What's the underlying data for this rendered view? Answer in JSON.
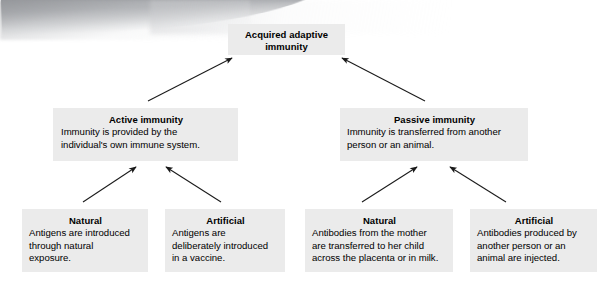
{
  "diagram": {
    "type": "hierarchy-tree",
    "nodes": {
      "root": {
        "title": "Acquired adaptive\nimmunity",
        "body": ""
      },
      "active": {
        "title": "Active immunity",
        "body": "Immunity is provided by the\nindividual's own immune system."
      },
      "passive": {
        "title": "Passive immunity",
        "body": "Immunity is transferred from another\nperson or an animal."
      },
      "active_natural": {
        "title": "Natural",
        "body": "Antigens are introduced\nthrough natural\nexposure."
      },
      "active_artificial": {
        "title": "Artificial",
        "body": "Antigens are\ndeliberately introduced\nin a vaccine."
      },
      "passive_natural": {
        "title": "Natural",
        "body": "Antibodies from the mother\nare transferred to her child\nacross the placenta or in milk."
      },
      "passive_artificial": {
        "title": "Artificial",
        "body": "Antibodies produced by\nanother person or an\nanimal are injected."
      }
    },
    "edges": [
      {
        "name": "active-to-root",
        "from": "active",
        "to": "root"
      },
      {
        "name": "passive-to-root",
        "from": "passive",
        "to": "root"
      },
      {
        "name": "active-natural-to-active",
        "from": "active_natural",
        "to": "active"
      },
      {
        "name": "active-artificial-to-active",
        "from": "active_artificial",
        "to": "active"
      },
      {
        "name": "passive-natural-to-passive",
        "from": "passive_natural",
        "to": "passive"
      },
      {
        "name": "passive-artificial-to-passive",
        "from": "passive_artificial",
        "to": "passive"
      }
    ],
    "colors": {
      "box_fill": "#ebebeb",
      "text": "#000000",
      "arrow": "#1a1a1a",
      "background": "#ffffff"
    }
  }
}
